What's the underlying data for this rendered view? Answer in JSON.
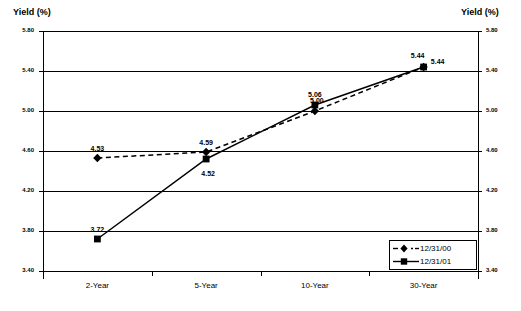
{
  "left_axis_title": "Yield (%)",
  "right_axis_title": "Yield (%)",
  "legend": {
    "items": [
      {
        "label": "12/31/00",
        "marker": "diamond-marker-icon",
        "line_style": "dashed",
        "color": "#000000"
      },
      {
        "label": "12/31/01",
        "marker": "square-marker-icon",
        "line_style": "solid",
        "color": "#000000"
      }
    ]
  },
  "ticks": {
    "y": [
      "5.80",
      "5.40",
      "5.00",
      "4.60",
      "4.20",
      "3.80",
      "3.40"
    ],
    "x": [
      "2-Year",
      "5-Year",
      "10-Year",
      "30-Year"
    ]
  },
  "point_labels": {
    "s0": [
      "4.53",
      "4.59",
      "5.00",
      "5.44"
    ],
    "s1": [
      "3.72",
      "4.52",
      "5.06",
      "5.44"
    ]
  },
  "chart_data": {
    "type": "line",
    "title": "",
    "xlabel": "",
    "ylabel": "Yield (%)",
    "y2label": "Yield (%)",
    "categories": [
      "2-Year",
      "5-Year",
      "10-Year",
      "30-Year"
    ],
    "series": [
      {
        "name": "12/31/00",
        "values": [
          4.53,
          4.59,
          5.0,
          5.44
        ],
        "marker": "diamond",
        "line_style": "dashed",
        "color": "#000000"
      },
      {
        "name": "12/31/01",
        "values": [
          3.72,
          4.52,
          5.06,
          5.44
        ],
        "marker": "square",
        "line_style": "solid",
        "color": "#000000"
      }
    ],
    "ylim": [
      3.4,
      5.8
    ],
    "ytick_values": [
      5.8,
      5.4,
      5.0,
      4.6,
      4.2,
      3.8,
      3.4
    ],
    "ytick_step": 0.4,
    "grid": "horizontal",
    "legend_position": "bottom-right",
    "data_labels": true
  }
}
